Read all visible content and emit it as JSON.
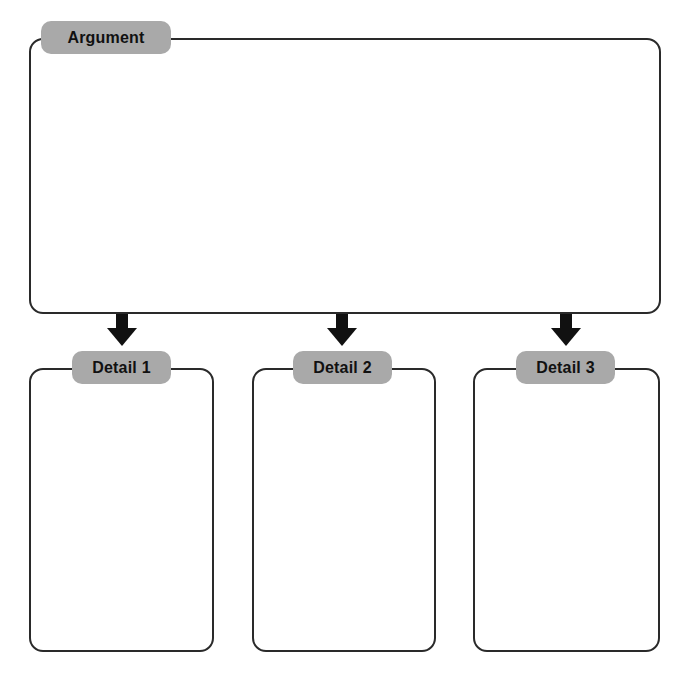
{
  "diagram": {
    "type": "argument-detail-organizer",
    "argument": {
      "label": "Argument",
      "content": ""
    },
    "details": [
      {
        "label": "Detail 1",
        "content": ""
      },
      {
        "label": "Detail 2",
        "content": ""
      },
      {
        "label": "Detail 3",
        "content": ""
      }
    ],
    "colors": {
      "stroke": "#2a2a2a",
      "label_bg": "#a9a9a9",
      "arrow": "#111111"
    }
  }
}
